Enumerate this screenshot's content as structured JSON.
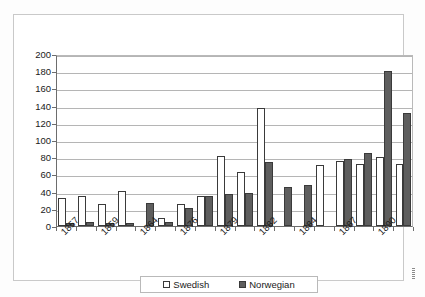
{
  "chart_data": {
    "type": "bar",
    "title": "",
    "xlabel": "",
    "ylabel": "",
    "ylim": [
      0,
      200
    ],
    "ytick_values": [
      0,
      20,
      40,
      60,
      80,
      100,
      120,
      140,
      160,
      180,
      200
    ],
    "ytick_labels": [
      "0",
      "20",
      "40",
      "60",
      "80",
      "100",
      "120",
      "140",
      "160",
      "180",
      "200"
    ],
    "grid": true,
    "legend_position": "bottom",
    "categories": [
      "1857",
      "",
      "1859",
      "",
      "1864",
      "",
      "1876",
      "",
      "1879",
      "",
      "1882",
      "",
      "1884",
      "",
      "1887",
      "",
      "1890",
      ""
    ],
    "visible_xtick_labels": [
      "1857",
      "1859",
      "1864",
      "1876",
      "1879",
      "1882",
      "1884",
      "1887",
      "1890"
    ],
    "series": [
      {
        "name": "Swedish",
        "color": "#ffffff",
        "edge_color": "#3a3a3a",
        "values": [
          33,
          35,
          26,
          41,
          0,
          9,
          26,
          35,
          81,
          63,
          137,
          0,
          0,
          71,
          76,
          72,
          80,
          72
        ]
      },
      {
        "name": "Norwegian",
        "color": "#5e5e5e",
        "edge_color": "#3a3a3a",
        "values": [
          3,
          5,
          4,
          4,
          27,
          5,
          21,
          35,
          37,
          38,
          74,
          45,
          48,
          0,
          78,
          85,
          180,
          131
        ]
      }
    ],
    "trailing_group": {
      "swedish": 30,
      "norwegian": 131
    }
  },
  "legend": {
    "entries": [
      {
        "label": "Swedish",
        "swatch": "white-square-swatch"
      },
      {
        "label": "Norwegian",
        "swatch": "dark-square-swatch"
      }
    ]
  },
  "colors": {
    "swedish_fill": "#ffffff",
    "norwegian_fill": "#5e5e5e",
    "bar_edge": "#3a3a3a",
    "gridline": "#b5b5b5",
    "axis": "#6d6d6d",
    "frame": "#c9c9c9",
    "text": "#1a1a1a",
    "background": "#ffffff"
  }
}
